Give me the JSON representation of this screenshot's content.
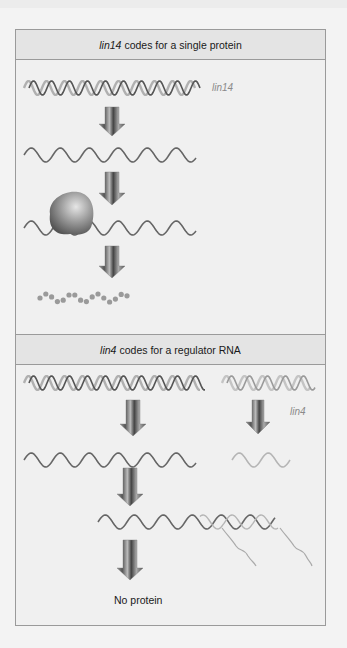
{
  "panels": [
    {
      "header_gene": "lin14",
      "header_text": "codes for a single protein",
      "gene_label": "lin14",
      "steps": [
        "DNA gene",
        "mRNA",
        "mRNA with ribosome",
        "protein chain"
      ]
    },
    {
      "header_gene": "lin4",
      "header_text": "codes for a regulator RNA",
      "gene_label": "lin4",
      "steps": [
        "lin14 DNA gene",
        "lin4 DNA gene",
        "lin14 mRNA",
        "lin4 regulator RNA",
        "mRNA bound by lin4 RNA",
        "outcome"
      ],
      "outcome_text": "No protein"
    }
  ],
  "colors": {
    "strand_dark": "#555555",
    "strand_light": "#b0b0b0",
    "arrow": "#6b6b6b",
    "protein_dot": "#9a9a9a",
    "ribosome": "#8a8a8a"
  }
}
